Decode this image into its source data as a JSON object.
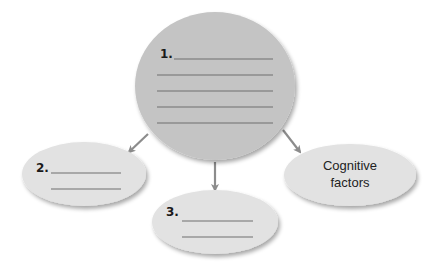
{
  "diagram": {
    "type": "concept-map",
    "central_node": {
      "number": "1.",
      "blank_lines": 5,
      "color": "#c4c4c4"
    },
    "child_nodes": [
      {
        "id": "node-2",
        "number": "2.",
        "blank_lines": 2,
        "color": "#e2e2e2"
      },
      {
        "id": "node-3",
        "number": "3.",
        "blank_lines": 2,
        "color": "#e2e2e2"
      },
      {
        "id": "node-cognitive",
        "label_line1": "Cognitive",
        "label_line2": "factors",
        "color": "#e2e2e2"
      }
    ],
    "arrow_color": "#8c8c8c",
    "line_color": "#6e6e6e"
  }
}
